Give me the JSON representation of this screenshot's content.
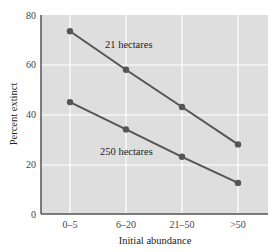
{
  "chart_data": {
    "type": "line",
    "title": "",
    "xlabel": "Initial abundance",
    "ylabel": "Percent extinct",
    "categories": [
      "0–5",
      "6–20",
      "21–50",
      ">50"
    ],
    "series": [
      {
        "name": "21 hectares",
        "values": [
          73.5,
          58,
          43,
          28
        ]
      },
      {
        "name": "250 hectares",
        "values": [
          45,
          34,
          23,
          12.5
        ]
      }
    ],
    "ylim": [
      0,
      80
    ],
    "yticks": [
      0,
      20,
      40,
      60,
      80
    ],
    "grid": true,
    "legend": "inline labels"
  },
  "colors": {
    "plot_bg": "#dedede",
    "grid": "#ffffff",
    "line": "#555555",
    "axis": "#555555"
  },
  "labels": {
    "series_21": "21 hectares",
    "series_250": "250 hectares",
    "xlabel": "Initial abundance",
    "ylabel": "Percent extinct",
    "yticks": [
      "0",
      "20",
      "40",
      "60",
      "80"
    ],
    "xticks": [
      "0–5",
      "6–20",
      "21–50",
      ">50"
    ]
  }
}
